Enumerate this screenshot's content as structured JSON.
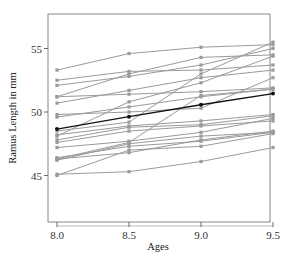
{
  "chart_data": {
    "type": "line",
    "title": "",
    "xlabel": "Ages",
    "ylabel": "Ramus Length in mm",
    "x": [
      8.0,
      8.5,
      9.0,
      9.5
    ],
    "xticks": [
      "8.0",
      "8.5",
      "9.0",
      "9.5"
    ],
    "yticks": [
      "45",
      "50",
      "55"
    ],
    "xlim": [
      7.93,
      9.48
    ],
    "ylim": [
      41.5,
      57.8
    ],
    "grid": false,
    "legend": null,
    "series_color": "#9a9a9a",
    "mean_color": "#111111",
    "series": [
      {
        "name": "Boy 1",
        "values": [
          47.8,
          48.8,
          49.0,
          49.7
        ]
      },
      {
        "name": "Boy 2",
        "values": [
          46.4,
          47.3,
          47.7,
          48.4
        ]
      },
      {
        "name": "Boy 3",
        "values": [
          46.3,
          46.8,
          47.8,
          48.5
        ]
      },
      {
        "name": "Boy 4",
        "values": [
          45.1,
          45.3,
          46.1,
          47.2
        ]
      },
      {
        "name": "Boy 5",
        "values": [
          47.6,
          48.5,
          48.9,
          49.3
        ]
      },
      {
        "name": "Boy 6",
        "values": [
          52.5,
          53.2,
          53.3,
          53.7
        ]
      },
      {
        "name": "Boy 7",
        "values": [
          51.2,
          53.0,
          54.3,
          54.5
        ]
      },
      {
        "name": "Boy 8",
        "values": [
          49.8,
          50.0,
          50.3,
          52.7
        ]
      },
      {
        "name": "Boy 9",
        "values": [
          48.1,
          50.8,
          52.3,
          54.4
        ]
      },
      {
        "name": "Boy 10",
        "values": [
          45.0,
          47.0,
          47.3,
          48.3
        ]
      },
      {
        "name": "Boy 11",
        "values": [
          51.2,
          51.4,
          51.6,
          51.9
        ]
      },
      {
        "name": "Boy 12",
        "values": [
          48.5,
          49.2,
          53.0,
          55.5
        ]
      },
      {
        "name": "Boy 13",
        "values": [
          52.1,
          52.8,
          53.7,
          55.0
        ]
      },
      {
        "name": "Boy 14",
        "values": [
          48.2,
          48.9,
          49.3,
          49.8
        ]
      },
      {
        "name": "Boy 15",
        "values": [
          49.6,
          50.4,
          51.2,
          51.8
        ]
      },
      {
        "name": "Boy 16",
        "values": [
          50.7,
          51.7,
          52.7,
          53.3
        ]
      },
      {
        "name": "Boy 17",
        "values": [
          47.2,
          47.7,
          48.4,
          49.5
        ]
      },
      {
        "name": "Boy 18",
        "values": [
          53.3,
          54.6,
          55.1,
          55.3
        ]
      },
      {
        "name": "Boy 19",
        "values": [
          46.2,
          47.5,
          48.1,
          48.4
        ]
      },
      {
        "name": "Boy 20",
        "values": [
          46.3,
          47.6,
          51.3,
          51.8
        ]
      }
    ],
    "mean": {
      "name": "Mean",
      "values": [
        48.66,
        49.63,
        50.57,
        51.45
      ]
    }
  }
}
